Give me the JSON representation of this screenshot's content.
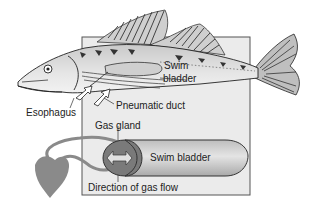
{
  "diagram": {
    "labels": {
      "swim_bladder_upper_line1": "Swim",
      "swim_bladder_upper_line2": "bladder",
      "esophagus": "Esophagus",
      "pneumatic_duct": "Pneumatic duct",
      "gas_gland": "Gas gland",
      "swim_bladder_inset": "Swim bladder",
      "direction_of_gas_flow": "Direction of gas flow"
    },
    "colors": {
      "inset_box_fill": "#ebebeb",
      "inset_box_border": "#555555",
      "bladder_fill": "#c8c8c8",
      "gas_gland_fill": "#7a7a7a",
      "heart_fill": "#8a8a8a",
      "vessel_stroke": "#8a8a8a",
      "fish_body": "#d9d9d9",
      "fish_outline": "#333333"
    },
    "icons": {
      "heart": "heart-shape",
      "gas_flow_arrow": "double-arrow-icon",
      "intake_arrows": "arrow-icon"
    }
  }
}
